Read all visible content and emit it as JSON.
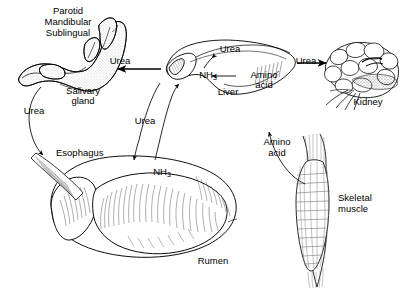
{
  "diagram": {
    "background_color": "#ffffff",
    "ink_color": "#000000"
  },
  "organs": [
    {
      "id": "salivary-gland",
      "label": "Salivary\ngland",
      "label_line1": "Salivary",
      "label_line2": "gland"
    },
    {
      "id": "liver",
      "label": "Liver"
    },
    {
      "id": "kidney",
      "label": "Kidney"
    },
    {
      "id": "rumen",
      "label": "Rumen"
    },
    {
      "id": "esophagus",
      "label": "Esophagus"
    },
    {
      "id": "skeletal-muscle",
      "label": "Skeletal\nmuscle",
      "label_line1": "Skeletal",
      "label_line2": "muscle"
    }
  ],
  "gland_types": {
    "line1": "Parotid",
    "line2": "Mandibular",
    "line3": "Sublingual"
  },
  "flows": [
    {
      "id": "urea-liver-to-salivary",
      "label": "Urea",
      "from": "liver",
      "to": "salivary-gland",
      "direction": "left"
    },
    {
      "id": "urea-liver-to-kidney",
      "label": "Urea",
      "from": "liver",
      "to": "kidney",
      "direction": "right"
    },
    {
      "id": "urea-salivary-to-esophagus",
      "label": "Urea",
      "from": "salivary-gland",
      "to": "esophagus",
      "direction": "down"
    },
    {
      "id": "urea-liver-to-rumen",
      "label": "Urea",
      "from": "liver",
      "to": "rumen",
      "direction": "down"
    },
    {
      "id": "ammonia-rumen-to-liver",
      "label": "NH3",
      "label_base": "NH",
      "label_sub": "3",
      "from": "rumen",
      "to": "liver",
      "direction": "up"
    },
    {
      "id": "ammonia-to-urea-in-liver",
      "label": "NH3",
      "label_base": "NH",
      "label_sub": "3",
      "from": "ammonia",
      "to": "urea",
      "direction": "up"
    },
    {
      "id": "amino-acid-to-ammonia",
      "label": "Amino acid",
      "label_line1": "Amino",
      "label_line2": "acid",
      "from": "amino-acid",
      "to": "ammonia",
      "direction": "left"
    },
    {
      "id": "amino-acid-muscle-to-liver",
      "label": "Amino acid",
      "label_line1": "Amino",
      "label_line2": "acid",
      "from": "skeletal-muscle",
      "to": "liver",
      "direction": "up"
    }
  ],
  "labels": {
    "urea_1": "Urea",
    "urea_2": "Urea",
    "urea_3": "Urea",
    "urea_4": "Urea",
    "urea_liver_top": "Urea",
    "nh3_liver_base": "NH",
    "nh3_liver_sub": "3",
    "nh3_rumen_base": "NH",
    "nh3_rumen_sub": "3",
    "amino_acid_liver_1": "Amino",
    "amino_acid_liver_2": "acid",
    "amino_acid_muscle_1": "Amino",
    "amino_acid_muscle_2": "acid",
    "liver": "Liver",
    "kidney": "Kidney",
    "rumen": "Rumen",
    "esophagus": "Esophagus",
    "salivary_1": "Salivary",
    "salivary_2": "gland",
    "muscle_1": "Skeletal",
    "muscle_2": "muscle",
    "parotid": "Parotid",
    "mandibular": "Mandibular",
    "sublingual": "Sublingual"
  }
}
